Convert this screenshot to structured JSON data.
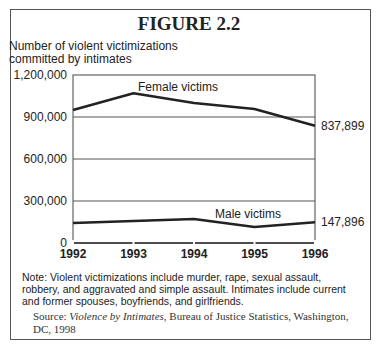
{
  "figure": {
    "title": "FIGURE 2.2",
    "y_axis_title_line1": "Number of violent victimizations",
    "y_axis_title_line2": "committed by intimates",
    "note": "Note:  Violent victimizations include murder, rape, sexual assault, robbery, and aggravated and simple assault.  Intimates include current and former spouses, boyfriends, and girlfriends.",
    "source_prefix": "Source: ",
    "source_title": "Violence by Intimates",
    "source_rest": ", Bureau of Justice Statistics, Washington, DC, 1998"
  },
  "chart_data": {
    "type": "line",
    "title": "FIGURE 2.2",
    "xlabel": "",
    "ylabel": "Number of violent victimizations committed by intimates",
    "x": [
      "1992",
      "1993",
      "1994",
      "1995",
      "1996"
    ],
    "yticks": [
      "1,200,000",
      "900,000",
      "600,000",
      "300,000",
      "0"
    ],
    "ylim": [
      0,
      1200000
    ],
    "grid": true,
    "series": [
      {
        "name": "Female victims",
        "values": [
          950000,
          1070000,
          1000000,
          957000,
          837899
        ],
        "end_label": "837,899"
      },
      {
        "name": "Male victims",
        "values": [
          143000,
          157000,
          171000,
          114000,
          147896
        ],
        "end_label": "147,896"
      }
    ],
    "annotations": [
      "Female victims",
      "Male victims",
      "837,899",
      "147,896"
    ]
  }
}
